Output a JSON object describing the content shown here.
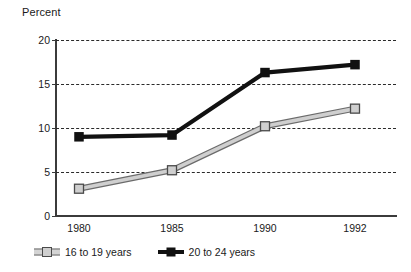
{
  "chart_data": {
    "type": "line",
    "title": "",
    "ylabel": "Percent",
    "xlabel": "",
    "categories": [
      "1980",
      "1985",
      "1990",
      "1992"
    ],
    "series": [
      {
        "name": "16 to 19 years",
        "values": [
          3.1,
          5.2,
          10.2,
          12.2
        ],
        "color": "#cfcfcf",
        "marker": "square-gray"
      },
      {
        "name": "20 to 24 years",
        "values": [
          9.0,
          9.2,
          16.3,
          17.2
        ],
        "color": "#111111",
        "marker": "square-black"
      }
    ],
    "ylim": [
      0,
      20
    ],
    "yticks": [
      0,
      5,
      10,
      15,
      20
    ],
    "ytick_labels": [
      "0",
      "5",
      "10",
      "15",
      "20"
    ],
    "grid": "horizontal-dashed",
    "legend_position": "bottom"
  },
  "legend": {
    "items": [
      {
        "label": "16 to 19 years"
      },
      {
        "label": "20 to 24 years"
      }
    ]
  },
  "colors": {
    "series_gray_fill": "#cfcfcf",
    "series_gray_edge": "#6b6b6b",
    "series_black": "#111111",
    "axis": "#3b3b3b",
    "grid": "#2a2a2a",
    "background": "#ffffff"
  }
}
